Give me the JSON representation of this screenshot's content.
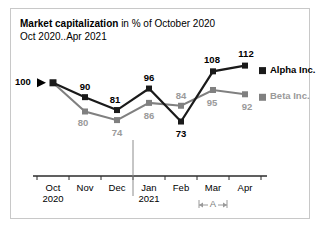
{
  "title": {
    "strong": "Market capitalization",
    "rest": " in % of October 2020",
    "subtitle": "Oct 2020..Apr 2021"
  },
  "chart_data": {
    "type": "line",
    "title": "Market capitalization in % of October 2020",
    "subtitle": "Oct 2020..Apr 2021",
    "xlabel": "",
    "ylabel": "",
    "categories": [
      "Oct",
      "Nov",
      "Dec",
      "Jan",
      "Feb",
      "Mar",
      "Apr"
    ],
    "category_sublabels": [
      "2020",
      "",
      "",
      "2021",
      "",
      "",
      ""
    ],
    "series": [
      {
        "name": "Alpha Inc.",
        "color": "#1a1a1a",
        "values": [
          100,
          90,
          81,
          96,
          73,
          108,
          112
        ],
        "label_color": "#000000"
      },
      {
        "name": "Beta Inc.",
        "color": "#808080",
        "values": [
          100,
          80,
          74,
          86,
          84,
          95,
          92
        ],
        "label_color": "#9a9a9a"
      }
    ],
    "baseline_label": "100",
    "ylim": [
      65,
      118
    ],
    "grid": false,
    "legend_position": "right",
    "annotations": [
      {
        "name": "A",
        "label": "A",
        "span_category": "Mar",
        "color": "#9a9a9a"
      }
    ],
    "year_divider_before": "Jan"
  },
  "legend": {
    "alpha": "Alpha Inc.",
    "beta": "Beta Inc."
  },
  "colors": {
    "alpha": "#1a1a1a",
    "beta": "#808080",
    "beta_label": "#9a9a9a",
    "axis": "#2b2b2b",
    "frame": "#c8c8c8"
  }
}
